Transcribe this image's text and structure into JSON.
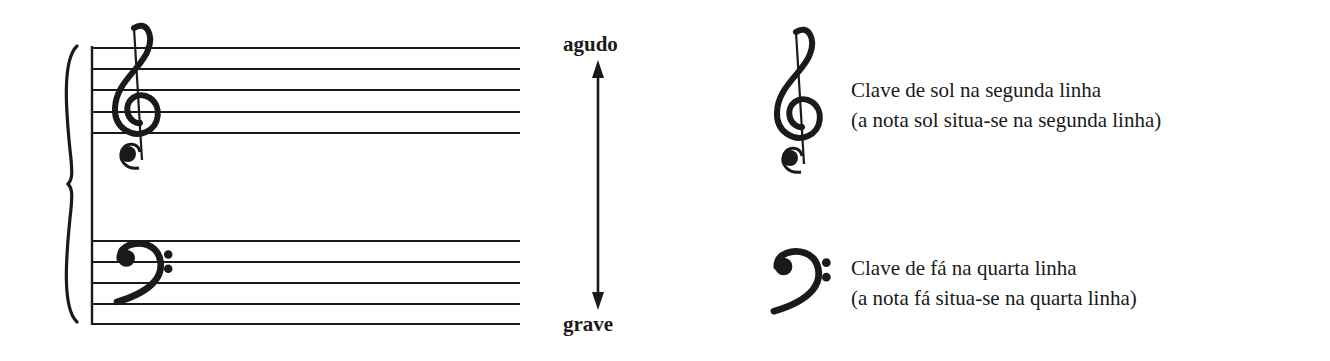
{
  "diagram": {
    "type": "grand-staff-clefs",
    "colors": {
      "ink": "#1a1a1a",
      "background": "#ffffff"
    },
    "grand_staff": {
      "treble_staff": {
        "clef": "treble-clef",
        "line_count": 5
      },
      "bass_staff": {
        "clef": "bass-clef",
        "line_count": 5
      },
      "brace": true
    },
    "pitch_arrow": {
      "top_label": "agudo",
      "bottom_label": "grave"
    },
    "legend": [
      {
        "icon": "treble-clef",
        "title": "Clave de sol na segunda linha",
        "subtitle": "(a nota sol situa-se na segunda linha)"
      },
      {
        "icon": "bass-clef",
        "title": "Clave de fá na quarta linha",
        "subtitle": "(a nota fá situa-se na quarta linha)"
      }
    ]
  }
}
